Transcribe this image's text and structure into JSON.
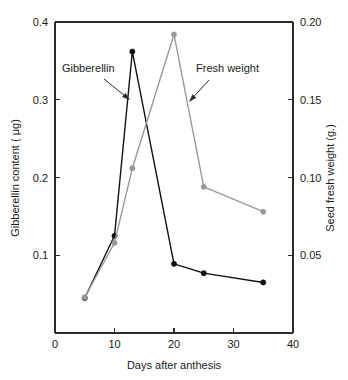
{
  "chart_data": {
    "type": "line",
    "title": "",
    "xlabel": "Days after anthesis",
    "ylabel": "Gibberellin content ( μg)",
    "ylabel_right": "Seed fresh weight (g.)",
    "xlim": [
      0,
      40
    ],
    "ylim": [
      0,
      0.4
    ],
    "ylim_right": [
      0,
      0.2
    ],
    "grid": false,
    "legend_position": "annotations-inline",
    "xticks": [
      0,
      10,
      20,
      30,
      40
    ],
    "xtick_labels": [
      "0",
      "10",
      "20",
      "30",
      "40"
    ],
    "yticks": [
      0.1,
      0.2,
      0.3,
      0.4
    ],
    "ytick_labels": [
      "0.1",
      "0.2",
      "0.3",
      "0.4"
    ],
    "yticks_right": [
      0.05,
      0.1,
      0.15,
      0.2
    ],
    "ytick_labels_right": [
      "0.05",
      "0.10",
      "0.15",
      "0.20"
    ],
    "x": [
      5,
      10,
      13,
      20,
      25,
      35
    ],
    "series": [
      {
        "name": "Gibberellin",
        "axis": "left",
        "color": "#111111",
        "marker": "filled-circle",
        "values": [
          0.045,
          0.125,
          0.362,
          0.089,
          0.077,
          0.065
        ]
      },
      {
        "name": "Fresh weight",
        "axis": "right",
        "color": "#999999",
        "marker": "filled-circle",
        "values": [
          0.023,
          0.058,
          0.106,
          0.192,
          0.094,
          0.078
        ]
      }
    ],
    "annotations": [
      {
        "text": "Gibberellin",
        "label_x": 62,
        "label_y": 72,
        "arrow_from_x": 104,
        "arrow_from_y": 79,
        "arrow_to_x": 130,
        "arrow_to_y": 100
      },
      {
        "text": "Fresh weight",
        "label_x": 196,
        "label_y": 72,
        "arrow_from_x": 209,
        "arrow_from_y": 80,
        "arrow_to_x": 189,
        "arrow_to_y": 102
      }
    ]
  },
  "plot_geometry": {
    "left": 55,
    "right": 293,
    "top": 22,
    "bottom": 333
  }
}
